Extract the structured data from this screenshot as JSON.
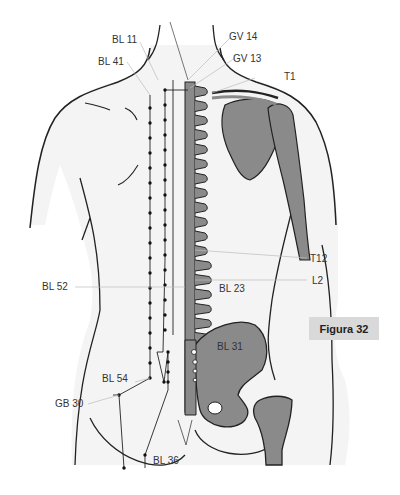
{
  "figure": {
    "caption": "Figura 32",
    "colors": {
      "bone": "#8a8a8a",
      "outline": "#222222",
      "skin_shadow": "#dcdcdc",
      "caption_bg": "#d9d9d9",
      "leader": "#bbbbbb"
    }
  },
  "labels": {
    "bl11": "BL 11",
    "bl41": "BL 41",
    "gv14": "GV 14",
    "gv13": "GV 13",
    "t1": "T1",
    "t12": "T12",
    "l2": "L2",
    "bl52": "BL 52",
    "bl23": "BL 23",
    "bl31": "BL 31",
    "bl54": "BL 54",
    "gb30": "GB 30",
    "bl36": "BL 36"
  }
}
